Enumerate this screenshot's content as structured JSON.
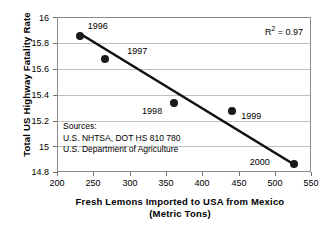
{
  "chart_data": {
    "type": "scatter",
    "title": "",
    "xlabel": "Fresh Lemons Imported to USA from Mexico (Metric Tons)",
    "xlabel_line1": "Fresh Lemons Imported to USA from Mexico",
    "xlabel_line2": "(Metric Tons)",
    "ylabel": "Total US Highway Fatality Rate",
    "xlim": [
      200,
      550
    ],
    "ylim": [
      14.8,
      16.0
    ],
    "xticks": [
      200,
      250,
      300,
      350,
      400,
      450,
      500,
      550
    ],
    "yticks": [
      "14.8",
      "15",
      "15.2",
      "15.4",
      "15.6",
      "15.8",
      "16"
    ],
    "grid": "horizontal",
    "legend": "none",
    "points": [
      {
        "label": "1996",
        "x": 230,
        "y": 15.86,
        "label_dx": 8,
        "label_dy": -14
      },
      {
        "label": "1997",
        "x": 265,
        "y": 15.68,
        "label_dx": 22,
        "label_dy": -12
      },
      {
        "label": "1998",
        "x": 360,
        "y": 15.34,
        "label_dx": -32,
        "label_dy": 4
      },
      {
        "label": "1999",
        "x": 440,
        "y": 15.28,
        "label_dx": 9,
        "label_dy": 1
      },
      {
        "label": "2000",
        "x": 525,
        "y": 14.87,
        "label_dx": -44,
        "label_dy": -6
      }
    ],
    "trendline": {
      "x1": 230,
      "y1": 15.88,
      "x2": 527,
      "y2": 14.86
    },
    "annotations": [
      {
        "name": "r-squared",
        "text_prefix": "R",
        "text_sup": "2",
        "text_suffix": " = 0.97",
        "value": 0.97
      }
    ],
    "sources": {
      "heading": "Sources:",
      "line1": "U.S. NHTSA, DOT HS 810 780",
      "line2": "U.S. Department of Agriculture"
    },
    "colors": {
      "marker": "#1a1a1a",
      "trendline": "#111111",
      "gridline": "#bfbfbf",
      "frame": "#8a8a8a",
      "text": "#000000",
      "background": "#ffffff"
    }
  }
}
